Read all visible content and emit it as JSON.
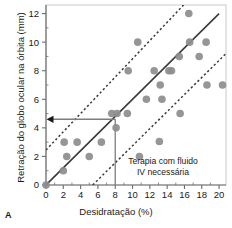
{
  "panel": {
    "label": "A"
  },
  "chart_data": {
    "type": "scatter",
    "title": "",
    "xlabel": "Desidratação (%)",
    "ylabel": "Retração do globo ocular na órbita (mm)",
    "xlim": [
      0,
      20.8
    ],
    "ylim": [
      0,
      12.6
    ],
    "xticks": [
      0,
      2,
      4,
      6,
      8,
      10,
      12,
      14,
      16,
      18,
      20
    ],
    "xtick_labels": [
      "0",
      "2",
      "4",
      "6",
      "8",
      "10",
      "12",
      "14",
      "16",
      "18",
      "20"
    ],
    "yticks": [
      0,
      2,
      4,
      6,
      8,
      10,
      12
    ],
    "ytick_labels": [
      "0",
      "2",
      "4",
      "6",
      "8",
      "10",
      "12"
    ],
    "minor_xtick_step": 1,
    "minor_ytick_step": 1,
    "grid": false,
    "legend": null,
    "marker_color": "#8d8d8d",
    "marker_size": 4.6,
    "points": [
      {
        "x": 0.0,
        "y": 0.0
      },
      {
        "x": 2.0,
        "y": 1.0
      },
      {
        "x": 2.1,
        "y": 3.0
      },
      {
        "x": 2.4,
        "y": 2.0
      },
      {
        "x": 3.6,
        "y": 3.0
      },
      {
        "x": 5.0,
        "y": 2.0
      },
      {
        "x": 6.4,
        "y": 3.0
      },
      {
        "x": 7.6,
        "y": 5.0
      },
      {
        "x": 8.2,
        "y": 5.0
      },
      {
        "x": 8.1,
        "y": 4.0
      },
      {
        "x": 9.4,
        "y": 5.0
      },
      {
        "x": 9.5,
        "y": 8.0
      },
      {
        "x": 10.6,
        "y": 10.0
      },
      {
        "x": 10.8,
        "y": 2.0
      },
      {
        "x": 11.6,
        "y": 6.0
      },
      {
        "x": 12.5,
        "y": 8.0
      },
      {
        "x": 13.2,
        "y": 7.0
      },
      {
        "x": 13.4,
        "y": 6.0
      },
      {
        "x": 14.2,
        "y": 8.0
      },
      {
        "x": 14.5,
        "y": 8.0
      },
      {
        "x": 15.4,
        "y": 9.0
      },
      {
        "x": 15.5,
        "y": 5.0
      },
      {
        "x": 16.5,
        "y": 12.0
      },
      {
        "x": 16.6,
        "y": 10.0
      },
      {
        "x": 17.7,
        "y": 9.0
      },
      {
        "x": 18.5,
        "y": 10.0
      },
      {
        "x": 18.6,
        "y": 7.0
      },
      {
        "x": 20.4,
        "y": 7.0
      }
    ],
    "regression_line": {
      "style": "solid",
      "color": "#3a3a3a",
      "points": [
        {
          "x": 0.0,
          "y": 0.0
        },
        {
          "x": 20.0,
          "y": 12.0
        }
      ]
    },
    "confidence_bands": [
      {
        "name": "upper",
        "style": "dashed",
        "color": "#3a3a3a",
        "points": [
          {
            "x": 0.0,
            "y": 2.45
          },
          {
            "x": 15.9,
            "y": 12.6
          }
        ]
      },
      {
        "name": "lower",
        "style": "dashed",
        "color": "#3a3a3a",
        "points": [
          {
            "x": 5.4,
            "y": 0.0
          },
          {
            "x": 20.8,
            "y": 9.2
          }
        ]
      }
    ],
    "annotations": [
      {
        "name": "threshold-marker",
        "type": "leader",
        "color": "#7d7d7d",
        "x_value": 8.0,
        "y_value": 4.6,
        "arrow_direction": "left",
        "vertical_from_y": 4.6,
        "vertical_to_y": 0.0,
        "horizontal_from_x": 8.0,
        "horizontal_to_x": 0.0
      },
      {
        "name": "fluid-therapy-note",
        "type": "text",
        "line1": "Terapia com fluido",
        "line2": "IV necessária",
        "x_value": 14.4,
        "y_value": 2.0
      }
    ]
  }
}
